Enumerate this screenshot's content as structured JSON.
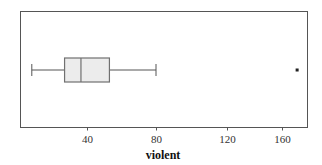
{
  "chart_data": {
    "type": "boxplot",
    "orientation": "horizontal",
    "title": "",
    "xlabel": "violent",
    "ylabel": "",
    "xticks": [
      40,
      80,
      120,
      160
    ],
    "xtick_labels": [
      "40",
      "80",
      "120",
      "160"
    ],
    "xlim": [
      0,
      175
    ],
    "grid": false,
    "legend": "none",
    "series": [
      {
        "name": "violent",
        "whisker_low": 8,
        "q1": 27,
        "median": 36.5,
        "q3": 53,
        "whisker_high": 80,
        "outliers": [
          171
        ]
      }
    ],
    "colors": {
      "box_fill": "#ececec",
      "box_stroke": "#707070",
      "whisker": "#555555",
      "frame": "#555555",
      "outlier": "#222222"
    }
  }
}
